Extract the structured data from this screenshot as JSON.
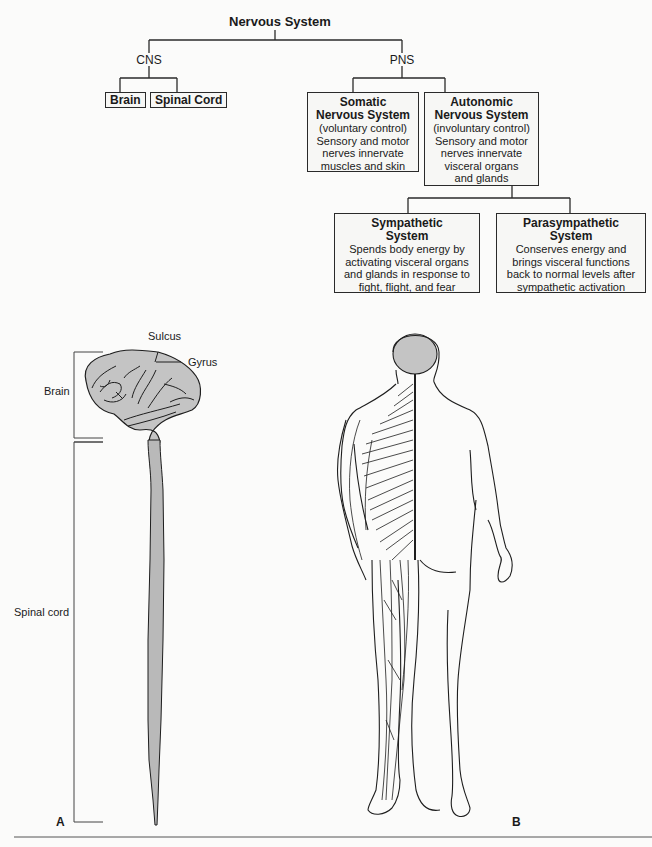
{
  "tree": {
    "root": "Nervous System",
    "cns": {
      "label": "CNS",
      "children": [
        "Brain",
        "Spinal Cord"
      ]
    },
    "pns": {
      "label": "PNS",
      "somatic": {
        "title_line1": "Somatic",
        "title_line2": "Nervous System",
        "lines": [
          "(voluntary control)",
          "Sensory and motor",
          "nerves innervate",
          "muscles and skin"
        ]
      },
      "autonomic": {
        "title_line1": "Autonomic",
        "title_line2": "Nervous System",
        "lines": [
          "(involuntary control)",
          "Sensory and motor",
          "nerves innervate",
          "visceral organs",
          "and glands"
        ]
      },
      "sympathetic": {
        "title_line1": "Sympathetic",
        "title_line2": "System",
        "lines": [
          "Spends body energy by",
          "activating visceral organs",
          "and glands in response to",
          "fight, flight, and fear"
        ]
      },
      "parasympathetic": {
        "title_line1": "Parasympathetic",
        "title_line2": "System",
        "lines": [
          "Conserves energy and",
          "brings visceral functions",
          "back to normal levels after",
          "sympathetic activation"
        ]
      }
    }
  },
  "figure_a": {
    "letter": "A",
    "labels": {
      "sulcus": "Sulcus",
      "gyrus": "Gyrus",
      "brain": "Brain",
      "spinal_cord": "Spinal cord"
    }
  },
  "figure_b": {
    "letter": "B"
  },
  "colors": {
    "line": "#2a2a2a",
    "fill_gray": "#b9b9b9",
    "background": "#fbfbfa"
  }
}
